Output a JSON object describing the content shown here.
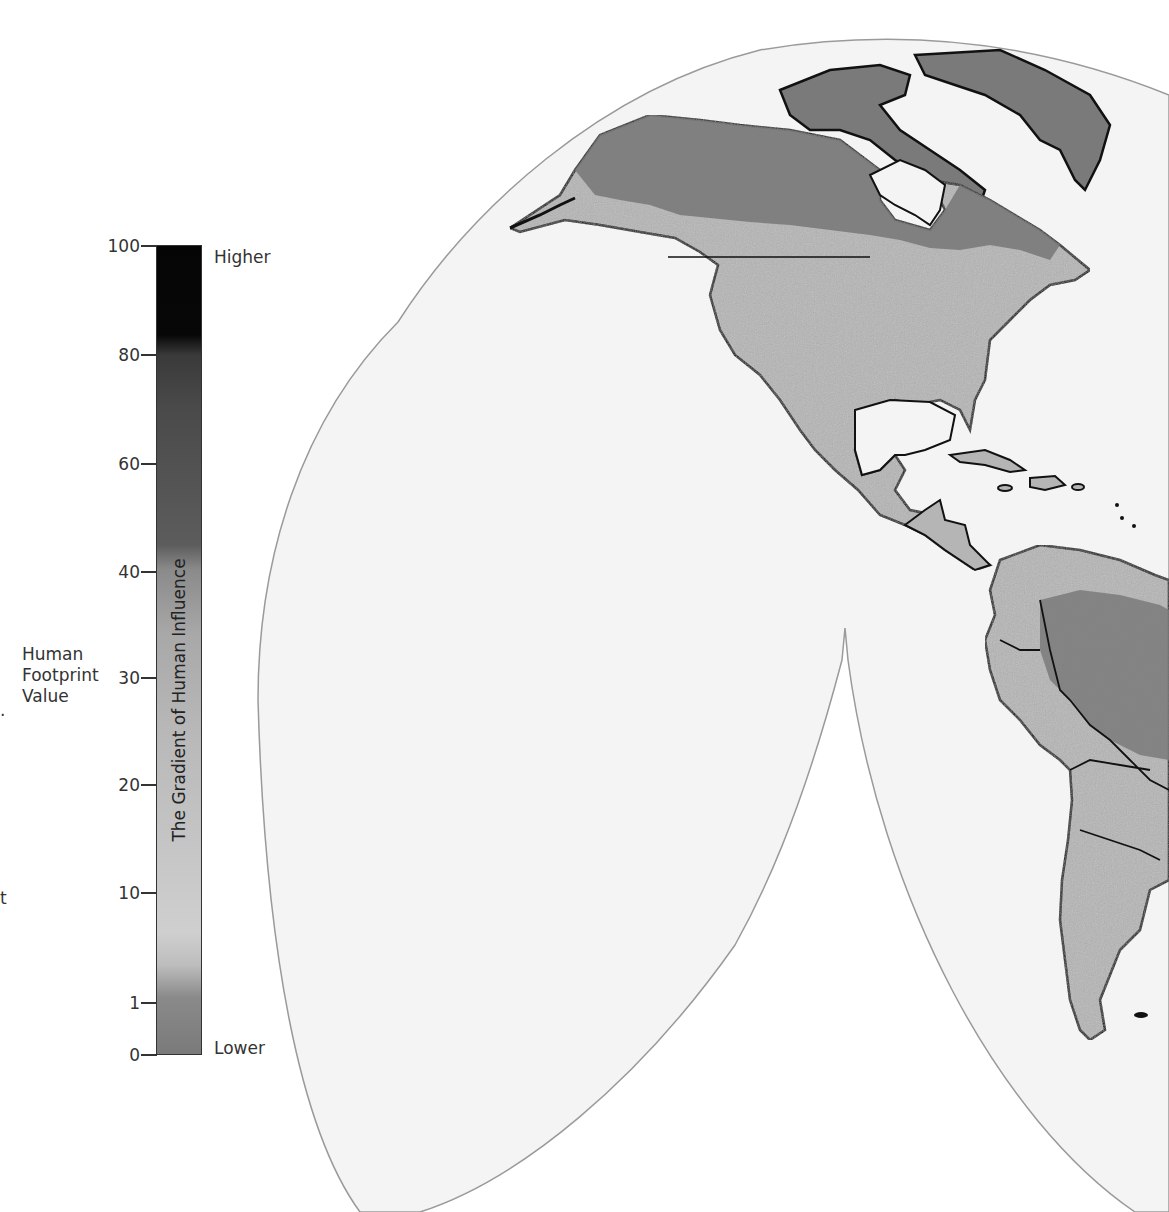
{
  "legend": {
    "axis_label": [
      "Human",
      "Footprint",
      "Value"
    ],
    "bar_title": "The Gradient of Human Influence",
    "high_label": "Higher",
    "low_label": "Lower",
    "ticks": [
      {
        "label": "100",
        "y": 245
      },
      {
        "label": "80",
        "y": 354
      },
      {
        "label": "60",
        "y": 463
      },
      {
        "label": "40",
        "y": 571
      },
      {
        "label": "30",
        "y": 677
      },
      {
        "label": "20",
        "y": 784
      },
      {
        "label": "10",
        "y": 892
      },
      {
        "label": "1",
        "y": 1002
      },
      {
        "label": "0",
        "y": 1054
      }
    ],
    "colors": {
      "higher": "#050505",
      "upper_mid": "#4a4a4a",
      "mid": "#a8a8a8",
      "low": "#cfcfcf",
      "lowest": "#7a7a7a"
    }
  },
  "edge_fragments": {
    "left_dot": ".",
    "left_t": "t"
  },
  "map": {
    "projection": "Goode homolosine (interrupted)",
    "region": "Americas",
    "ocean_color": "#f4f4f4",
    "land_color": "#b8b8b8",
    "wild_land_color": "#7a7a7a",
    "border_color": "#111111",
    "outline_color": "#999999",
    "labels": [
      "North America",
      "South America",
      "Greenland"
    ]
  }
}
